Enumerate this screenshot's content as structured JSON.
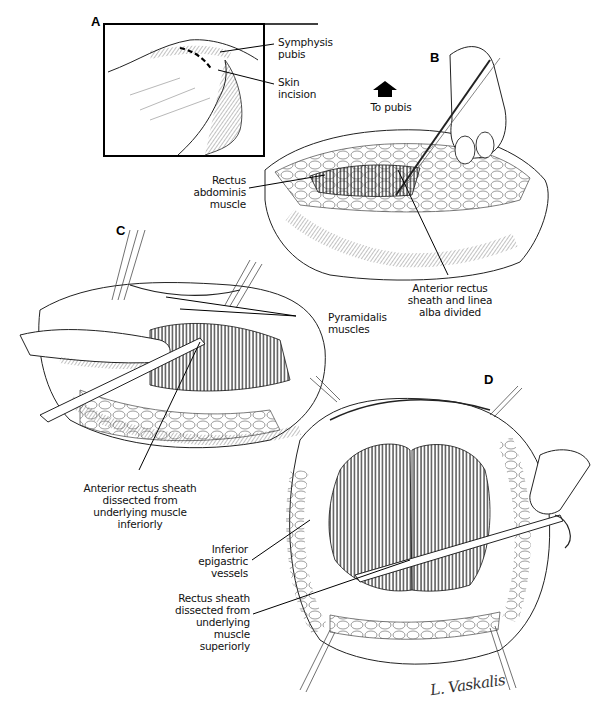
{
  "figure": {
    "panels": [
      {
        "letter": "A",
        "labels": [
          "Symphysis pubis",
          "Skin incision"
        ]
      },
      {
        "letter": "B",
        "labels": [
          "To pubis",
          "Rectus abdominis muscle",
          "Anterior rectus sheath and linea alba divided"
        ]
      },
      {
        "letter": "C",
        "labels": [
          "Pyramidalis muscles",
          "Anterior rectus sheath dissected from underlying muscle inferiorly"
        ]
      },
      {
        "letter": "D",
        "labels": [
          "Inferior epigastric vessels",
          "Rectus sheath dissected from underlying muscle superiorly"
        ]
      }
    ],
    "A": {
      "letter": "A",
      "symphysis": [
        "Symphysis",
        "pubis"
      ],
      "incision": [
        "Skin",
        "incision"
      ]
    },
    "B": {
      "letter": "B",
      "to_pubis": "To pubis",
      "direction_icon": "arrow-up-icon",
      "rectus": [
        "Rectus",
        "abdominis",
        "muscle"
      ],
      "sheath": [
        "Anterior rectus",
        "sheath and linea",
        "alba divided"
      ]
    },
    "C": {
      "letter": "C",
      "pyramidalis": [
        "Pyramidalis",
        "muscles"
      ],
      "dissected": [
        "Anterior rectus sheath",
        "dissected from",
        "underlying muscle",
        "inferiorly"
      ]
    },
    "D": {
      "letter": "D",
      "epigastric": [
        "Inferior",
        "epigastric",
        "vessels"
      ],
      "dissected": [
        "Rectus sheath",
        "dissected from",
        "underlying",
        "muscle",
        "superiorly"
      ]
    },
    "signature": "L. Vaskalis"
  }
}
